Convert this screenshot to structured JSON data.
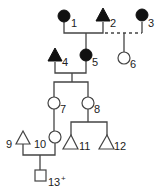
{
  "individuals": [
    {
      "id": "1",
      "label": "1",
      "shape": "circle",
      "affected": true
    },
    {
      "id": "2",
      "label": "2",
      "shape": "triangle",
      "affected": true
    },
    {
      "id": "3",
      "label": "3",
      "shape": "circle",
      "affected": true
    },
    {
      "id": "4",
      "label": "4",
      "shape": "triangle",
      "affected": true
    },
    {
      "id": "5",
      "label": "5",
      "shape": "circle",
      "affected": true
    },
    {
      "id": "6",
      "label": "6",
      "shape": "circle",
      "affected": false
    },
    {
      "id": "7",
      "label": "7",
      "shape": "circle",
      "affected": false
    },
    {
      "id": "8",
      "label": "8",
      "shape": "circle",
      "affected": false
    },
    {
      "id": "9",
      "label": "9",
      "shape": "triangle",
      "affected": false
    },
    {
      "id": "10",
      "label": "10",
      "shape": "circle",
      "affected": false
    },
    {
      "id": "11",
      "label": "11",
      "shape": "triangle",
      "affected": false
    },
    {
      "id": "12",
      "label": "12",
      "shape": "triangle",
      "affected": false
    },
    {
      "id": "13",
      "label": "13",
      "shape": "square",
      "affected": false,
      "superscript": "+"
    }
  ],
  "relationships": [
    {
      "partners": [
        "1",
        "2"
      ],
      "style": "solid",
      "children": [
        "5"
      ]
    },
    {
      "partners": [
        "2",
        "3"
      ],
      "style": "dashed",
      "children": [
        "6"
      ]
    },
    {
      "partners": [
        "4",
        "5"
      ],
      "style": "solid",
      "children": [
        "7",
        "8"
      ]
    },
    {
      "descent": [
        "7",
        "10"
      ],
      "style": "solid"
    },
    {
      "partners": [
        "8"
      ],
      "style": "solid",
      "children": [
        "11",
        "12"
      ]
    },
    {
      "partners": [
        "9",
        "10"
      ],
      "style": "solid",
      "children": [
        "13"
      ]
    }
  ],
  "colors": {
    "affected": "#111111",
    "unaffected": "#ffffff",
    "line": "#444444"
  }
}
